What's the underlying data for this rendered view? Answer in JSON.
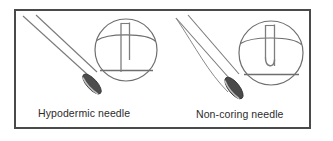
{
  "figure": {
    "background_color": "#ffffff",
    "frame": {
      "name": "figure-border",
      "color": "#4a4a4a",
      "x": 14,
      "y": 9,
      "width": 297,
      "height": 120,
      "stroke_width": 2
    },
    "line_color": "#6e6e6e",
    "dark_line_color": "#3f3f3f",
    "tip_fill_color": "#4d4d4d",
    "tip_highlight_color": "#b9b9b9",
    "text_color": "#2b2b2b"
  },
  "panels": [
    {
      "id": "hypodermic",
      "label": "Hypodermic needle",
      "label_x": 38,
      "label_y": 117,
      "needle": {
        "name": "hypodermic-needle",
        "shaft_upper": "M 22,15 L 88,74",
        "shaft_lower": "M 35,14 L 98,72",
        "tip_center_x": 92,
        "tip_center_y": 82,
        "tip_rx": 5.2,
        "tip_ry": 12.5,
        "tip_rotation": -42,
        "bevel_type": "beveled-cutting-tip"
      },
      "inset": {
        "name": "hypodermic-inset",
        "circle_cx": 126,
        "circle_cy": 50,
        "circle_r": 31,
        "septum_top_y": 34,
        "septum_bottom_y": 69,
        "needle_wall_left_x": 121,
        "needle_wall_right_x": 129,
        "track_bottom_y": 72,
        "tip_shape": "straight-cutting",
        "description": "Straight cutting tip punches a core out of the septum"
      }
    },
    {
      "id": "non-coring",
      "label": "Non-coring needle",
      "label_x": 196,
      "label_y": 118,
      "needle": {
        "name": "non-coring-needle",
        "shaft_upper": "M 176,17 L 228,76",
        "shaft_lower": "M 188,14 L 239,74",
        "shaft_lower_curve": "M 176,17 C 196,45 210,68 232,90",
        "tip_center_x": 233,
        "tip_center_y": 86,
        "tip_rx": 5.6,
        "tip_ry": 13,
        "tip_rotation": -38,
        "bevel_type": "deflected-non-coring-tip"
      },
      "inset": {
        "name": "non-coring-inset",
        "circle_cx": 271,
        "circle_cy": 53,
        "circle_r": 32,
        "septum_top_y": 37,
        "septum_bottom_y": 73,
        "needle_wall_left_x": 265,
        "needle_wall_right_x": 274,
        "track_bottom_y": 66,
        "tip_shape": "curved-j-deflecting",
        "description": "Curved non-coring tip parts the septum without removing a core"
      }
    }
  ]
}
